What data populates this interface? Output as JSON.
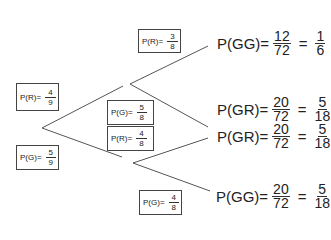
{
  "diagram": {
    "type": "probability-tree",
    "first_branches": [
      {
        "label": "P(R)=",
        "num": "4",
        "den": "9"
      },
      {
        "label": "P(G)=",
        "num": "5",
        "den": "9"
      }
    ],
    "second_branches": [
      {
        "label": "P(R)=",
        "num": "3",
        "den": "8"
      },
      {
        "label": "P(G)=",
        "num": "5",
        "den": "8"
      },
      {
        "label": "P(R)=",
        "num": "4",
        "den": "8"
      },
      {
        "label": "P(G)=",
        "num": "4",
        "den": "8"
      }
    ],
    "outcomes": [
      {
        "label": "P(GG)=",
        "num": "12",
        "den": "72",
        "eq": "=",
        "snum": "1",
        "sden": "6"
      },
      {
        "label": "P(GR)=",
        "num": "20",
        "den": "72",
        "eq": "=",
        "snum": "5",
        "sden": "18"
      },
      {
        "label": "P(GR)=",
        "num": "20",
        "den": "72",
        "eq": "=",
        "snum": "5",
        "sden": "18"
      },
      {
        "label": "P(GG)=",
        "num": "20",
        "den": "72",
        "eq": "=",
        "snum": "5",
        "sden": "18"
      }
    ]
  }
}
